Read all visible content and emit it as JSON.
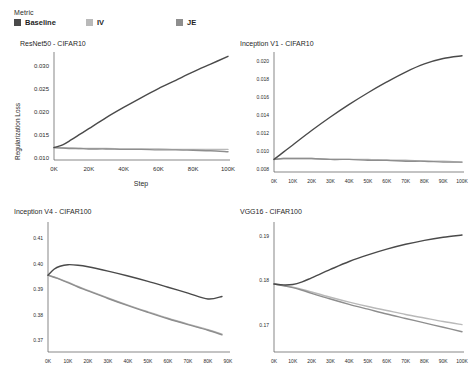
{
  "legend": {
    "title": "Metric",
    "items": [
      {
        "label": "Baseline",
        "color": "#4a4a4a"
      },
      {
        "label": "IV",
        "color": "#b9b9b9"
      },
      {
        "label": "JE",
        "color": "#8e8e8e"
      }
    ]
  },
  "chart_data": [
    {
      "type": "line",
      "title": "ResNet50 - CIFAR10",
      "xlabel": "Step",
      "ylabel": "Regularization Loss",
      "xlim": [
        0,
        100000
      ],
      "ylim": [
        0.0095,
        0.0325
      ],
      "grid": false,
      "legend_position": "top-left-shared",
      "xticks": [
        0,
        20000,
        40000,
        60000,
        80000,
        100000
      ],
      "xticklabels": [
        "0K",
        "20K",
        "40K",
        "60K",
        "80K",
        "100K"
      ],
      "yticks": [
        0.01,
        0.015,
        0.02,
        0.025,
        0.03
      ],
      "yticklabels": [
        "0.010",
        "0.015",
        "0.020",
        "0.025",
        "0.030"
      ],
      "x": [
        0,
        5000,
        10000,
        15000,
        20000,
        30000,
        40000,
        50000,
        60000,
        70000,
        80000,
        90000,
        100000
      ],
      "series": [
        {
          "name": "Baseline",
          "color": "#4a4a4a",
          "values": [
            0.0122,
            0.0128,
            0.0139,
            0.0151,
            0.0163,
            0.0187,
            0.0209,
            0.023,
            0.025,
            0.0268,
            0.0286,
            0.0303,
            0.032
          ]
        },
        {
          "name": "IV",
          "color": "#b9b9b9",
          "values": [
            0.0122,
            0.0121,
            0.0121,
            0.012,
            0.012,
            0.012,
            0.0119,
            0.0119,
            0.0119,
            0.0118,
            0.0118,
            0.0118,
            0.0118
          ]
        },
        {
          "name": "JE",
          "color": "#8e8e8e",
          "values": [
            0.0122,
            0.0121,
            0.012,
            0.012,
            0.0119,
            0.0119,
            0.0118,
            0.0118,
            0.0117,
            0.0117,
            0.0116,
            0.0115,
            0.0113
          ]
        }
      ]
    },
    {
      "type": "line",
      "title": "Inception V1 - CIFAR10",
      "xlabel": "",
      "ylabel": "",
      "xlim": [
        0,
        100000
      ],
      "ylim": [
        0.0077,
        0.0208
      ],
      "grid": false,
      "xticks": [
        0,
        10000,
        20000,
        30000,
        40000,
        50000,
        60000,
        70000,
        80000,
        90000,
        100000
      ],
      "xticklabels": [
        "0K",
        "10K",
        "20K",
        "30K",
        "40K",
        "50K",
        "60K",
        "70K",
        "80K",
        "90K",
        "100K"
      ],
      "yticks": [
        0.008,
        0.01,
        0.012,
        0.014,
        0.016,
        0.018,
        0.02
      ],
      "yticklabels": [
        "0.008",
        "0.010",
        "0.012",
        "0.014",
        "0.016",
        "0.018",
        "0.020"
      ],
      "x": [
        0,
        5000,
        10000,
        20000,
        30000,
        40000,
        50000,
        60000,
        70000,
        80000,
        90000,
        100000
      ],
      "series": [
        {
          "name": "Baseline",
          "color": "#4a4a4a",
          "values": [
            0.0091,
            0.0099,
            0.0107,
            0.0123,
            0.0138,
            0.0152,
            0.0165,
            0.0177,
            0.0188,
            0.0197,
            0.0203,
            0.0206
          ]
        },
        {
          "name": "IV",
          "color": "#b9b9b9",
          "values": [
            0.0091,
            0.0092,
            0.0092,
            0.0092,
            0.0091,
            0.0091,
            0.0091,
            0.009,
            0.009,
            0.0089,
            0.0089,
            0.0088
          ]
        },
        {
          "name": "JE",
          "color": "#8e8e8e",
          "values": [
            0.0091,
            0.0092,
            0.0092,
            0.0092,
            0.0091,
            0.0091,
            0.009,
            0.009,
            0.0089,
            0.0089,
            0.0088,
            0.0088
          ]
        }
      ]
    },
    {
      "type": "line",
      "title": "Inception V4 - CIFAR100",
      "xlabel": "",
      "ylabel": "",
      "xlim": [
        0,
        90000
      ],
      "ylim": [
        0.3655,
        0.4155
      ],
      "grid": false,
      "xticks": [
        0,
        10000,
        20000,
        30000,
        40000,
        50000,
        60000,
        70000,
        80000,
        90000
      ],
      "xticklabels": [
        "0K",
        "10K",
        "20K",
        "30K",
        "40K",
        "50K",
        "60K",
        "70K",
        "80K",
        "90K"
      ],
      "yticks": [
        0.37,
        0.38,
        0.39,
        0.4,
        0.41
      ],
      "yticklabels": [
        "0.37",
        "0.38",
        "0.39",
        "0.40",
        "0.41"
      ],
      "x": [
        0,
        3000,
        6000,
        10000,
        15000,
        20000,
        30000,
        40000,
        50000,
        60000,
        70000,
        80000,
        87000
      ],
      "series": [
        {
          "name": "Baseline",
          "color": "#4a4a4a",
          "values": [
            0.3955,
            0.3978,
            0.399,
            0.3996,
            0.3994,
            0.3988,
            0.3971,
            0.3952,
            0.3931,
            0.3908,
            0.3885,
            0.3862,
            0.3872
          ]
        },
        {
          "name": "IV",
          "color": "#b9b9b9",
          "values": [
            0.3955,
            0.3948,
            0.394,
            0.3928,
            0.3911,
            0.3896,
            0.3866,
            0.3838,
            0.3812,
            0.3787,
            0.3764,
            0.3742,
            0.3725
          ]
        },
        {
          "name": "JE",
          "color": "#8e8e8e",
          "values": [
            0.3955,
            0.3947,
            0.3939,
            0.3926,
            0.3909,
            0.3894,
            0.3864,
            0.3836,
            0.381,
            0.3785,
            0.3762,
            0.374,
            0.3722
          ]
        }
      ]
    },
    {
      "type": "line",
      "title": "VGG16 - CIFAR100",
      "xlabel": "",
      "ylabel": "",
      "xlim": [
        0,
        100000
      ],
      "ylim": [
        0.1638,
        0.1928
      ],
      "grid": false,
      "xticks": [
        0,
        10000,
        20000,
        30000,
        40000,
        50000,
        60000,
        70000,
        80000,
        90000,
        100000
      ],
      "xticklabels": [
        "0K",
        "10K",
        "20K",
        "30K",
        "40K",
        "50K",
        "60K",
        "70K",
        "80K",
        "90K",
        "100K"
      ],
      "yticks": [
        0.17,
        0.18,
        0.19
      ],
      "yticklabels": [
        "0.17",
        "0.18",
        "0.19"
      ],
      "x": [
        0,
        5000,
        10000,
        15000,
        20000,
        30000,
        40000,
        50000,
        60000,
        70000,
        80000,
        90000,
        100000
      ],
      "series": [
        {
          "name": "Baseline",
          "color": "#4a4a4a",
          "values": [
            0.1792,
            0.179,
            0.1791,
            0.1797,
            0.1806,
            0.1825,
            0.1843,
            0.1858,
            0.1871,
            0.1882,
            0.1891,
            0.1898,
            0.1903
          ]
        },
        {
          "name": "IV",
          "color": "#b9b9b9",
          "values": [
            0.1792,
            0.1789,
            0.1785,
            0.178,
            0.1774,
            0.1762,
            0.1751,
            0.1741,
            0.1732,
            0.1723,
            0.1715,
            0.1707,
            0.17
          ]
        },
        {
          "name": "JE",
          "color": "#8e8e8e",
          "values": [
            0.1792,
            0.1788,
            0.1784,
            0.1778,
            0.1771,
            0.1758,
            0.1746,
            0.1735,
            0.1724,
            0.1714,
            0.1704,
            0.1694,
            0.1684
          ]
        }
      ]
    }
  ]
}
